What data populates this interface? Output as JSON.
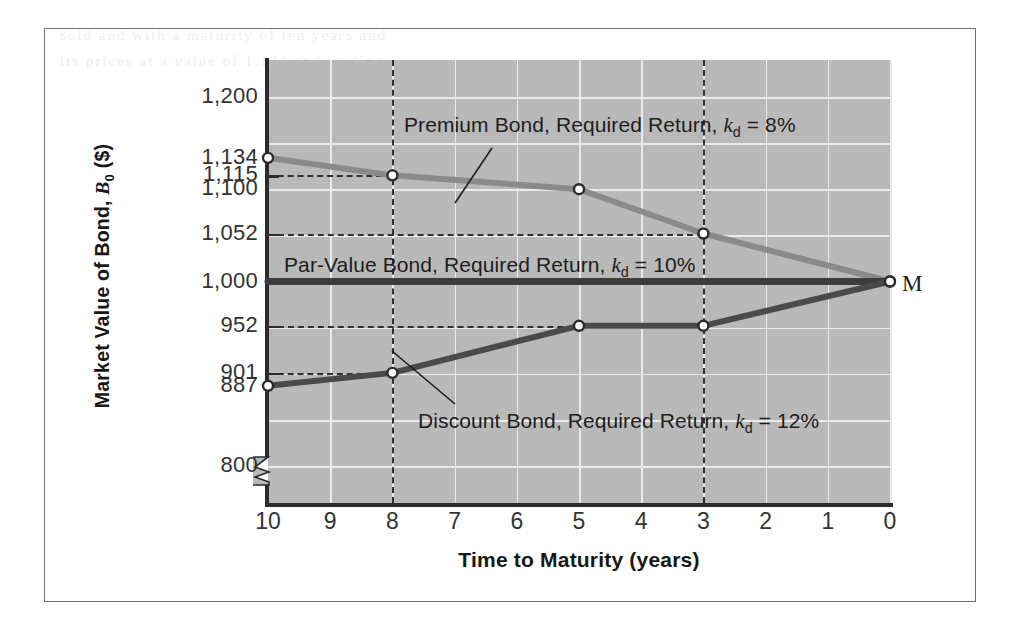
{
  "figure": {
    "ghost_bleed_text": "sold and  with  a  maturity of  ten  years  and\nits  prices  at  a  value  of  1,134  and  trading",
    "maturity_marker_label": "M"
  },
  "chart_data": {
    "type": "line",
    "title": "",
    "xlabel": "Time to Maturity (years)",
    "ylabel": "Market Value of Bond, B₀ ($)",
    "ylabel_parts": {
      "prefix": "Market Value of Bond, ",
      "italic": "B",
      "sub": "0",
      "suffix": " ($)"
    },
    "x_tick_labels": [
      "10",
      "9",
      "8",
      "7",
      "6",
      "5",
      "4",
      "3",
      "2",
      "1",
      "0"
    ],
    "x_values": [
      10,
      9,
      8,
      7,
      6,
      5,
      4,
      3,
      2,
      1,
      0
    ],
    "xlim": [
      10,
      0
    ],
    "x_axis_reversed": true,
    "y_tick_labels": [
      "1,200",
      "1,134",
      "1,115",
      "1,100",
      "1,052",
      "1,000",
      "952",
      "901",
      "887",
      "800"
    ],
    "y_tick_values": [
      1200,
      1134,
      1115,
      1100,
      1052,
      1000,
      952,
      901,
      887,
      800
    ],
    "ylim": [
      760,
      1240
    ],
    "y_axis_break": true,
    "grid": true,
    "grid_color": "#eaeaea",
    "plot_background": "#b9b9b9",
    "legend_position": "inline-annotations",
    "series": [
      {
        "name": "Premium Bond, Required Return, k_d = 8%",
        "label_prefix": "Premium Bond, Required Return, ",
        "label_symbol": "k",
        "label_sub": "d",
        "label_suffix": " = 8%",
        "color": "#8a8a8a",
        "x": [
          10,
          8,
          5,
          3,
          0
        ],
        "values": [
          1134,
          1115,
          1100,
          1052,
          1000
        ],
        "markers": true
      },
      {
        "name": "Par-Value Bond, Required Return, k_d = 10%",
        "label_prefix": "Par-Value Bond, Required Return, ",
        "label_symbol": "k",
        "label_sub": "d",
        "label_suffix": " = 10%",
        "color": "#3c3c3c",
        "x": [
          10,
          0
        ],
        "values": [
          1000,
          1000
        ],
        "markers": false
      },
      {
        "name": "Discount Bond, Required Return, k_d = 12%",
        "label_prefix": "Discount Bond, Required Return, ",
        "label_symbol": "k",
        "label_sub": "d",
        "label_suffix": " = 12%",
        "color": "#4a4a4a",
        "x": [
          10,
          8,
          5,
          3,
          0
        ],
        "values": [
          887,
          901,
          952,
          952,
          1000
        ],
        "markers": true
      }
    ],
    "annotations": [
      {
        "text": "M",
        "x": 0,
        "y": 1000,
        "note": "maturity convergence point at par value"
      }
    ],
    "guide_lines": [
      {
        "orientation": "horizontal",
        "value": 1115,
        "style": "dashed",
        "from_x": 10,
        "to_x": 8
      },
      {
        "orientation": "horizontal",
        "value": 1052,
        "style": "dashed",
        "from_x": 10,
        "to_x": 3
      },
      {
        "orientation": "horizontal",
        "value": 952,
        "style": "dashed",
        "from_x": 10,
        "to_x": 3
      },
      {
        "orientation": "horizontal",
        "value": 901,
        "style": "dashed",
        "from_x": 10,
        "to_x": 8
      },
      {
        "orientation": "vertical",
        "value": 8,
        "style": "dashed"
      },
      {
        "orientation": "vertical",
        "value": 3,
        "style": "dashed"
      }
    ]
  }
}
